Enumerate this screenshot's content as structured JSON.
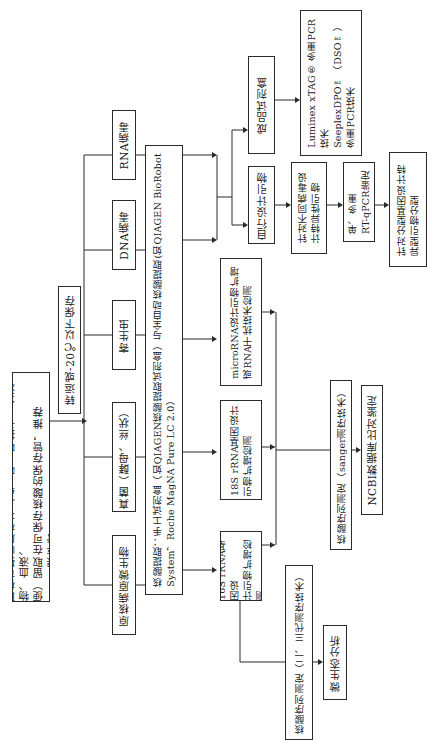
{
  "diagram": {
    "orientation": "rotated 90deg counter-clockwise (text reads bottom-to-top)",
    "nodes": {
      "sampling": "取样可疑临床标本（鼻、喉、咽拭子、分泌物、血液、\n便）留取在可保存核酸的保存管，推荐copan保存管",
      "transport": "转运或-20℃以下保存",
      "prokaryote": "原核病原微生物",
      "fungi": "真菌（酵母、丝状）",
      "parasite": "寄生虫",
      "dna_virus": "DNA病毒",
      "rna_virus": "RNA病毒",
      "extraction": "核酸提取：手工试剂盒（如QIAGEN核酸提取试剂盒）与全自动核酸提取(如QIAGEN BioRobot\nSystem，Roche MagNA Pure LC 2.0）",
      "rrna16s": "16S rRNA基因设\n计引物扩增检测",
      "rrna18s": "18S rRNA基因设计\n引物扩增检测",
      "microrna": "microRNA设计引物扩增\n或RNA干扰技术检测",
      "self_primer": "自行设计引物",
      "kit": "成品试剂盒",
      "virus_primer": "针对不同病毒设\n计特异性引物",
      "multiplex": "Luminex xTAG® 多重PCR\n技术\nSeeplexDPO™（DSO™）\n多重PCR技术",
      "rtqpcr": "单、多重\nRT-qPCR鉴定",
      "genotype": "针对分型基因设计特\n异型引物分型",
      "ngs": "核酸序列测定（二、三代测序技术）",
      "microecology": "微生态分析",
      "sanger": "核酸序列测定（sanger测序技术）",
      "ncbi": "NCBI数据库比对鉴定"
    },
    "edges": [
      [
        "sampling",
        "transport"
      ],
      [
        "transport",
        "prokaryote"
      ],
      [
        "transport",
        "fungi"
      ],
      [
        "transport",
        "parasite"
      ],
      [
        "transport",
        "dna_virus"
      ],
      [
        "transport",
        "rna_virus"
      ],
      [
        "extraction",
        "rrna16s"
      ],
      [
        "extraction",
        "rrna18s"
      ],
      [
        "extraction",
        "microrna"
      ],
      [
        "extraction",
        "self_primer"
      ],
      [
        "extraction",
        "kit"
      ],
      [
        "self_primer",
        "virus_primer"
      ],
      [
        "kit",
        "multiplex"
      ],
      [
        "virus_primer",
        "rtqpcr"
      ],
      [
        "rtqpcr",
        "genotype"
      ],
      [
        "rrna16s",
        "ngs"
      ],
      [
        "ngs",
        "microecology"
      ],
      [
        "rrna16s",
        "sanger"
      ],
      [
        "rrna18s",
        "sanger"
      ],
      [
        "microrna",
        "sanger"
      ],
      [
        "sanger",
        "ncbi"
      ]
    ]
  }
}
